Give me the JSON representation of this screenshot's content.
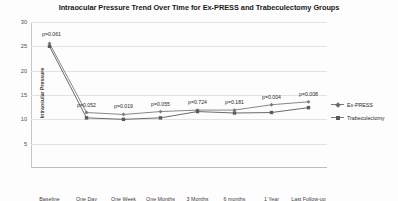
{
  "chart_data": {
    "type": "line",
    "title": "Intraocular Pressure Trend Over Time for Ex-PRESS and Trabeculectomy Groups",
    "xlabel": "",
    "ylabel": "Intraocular Pressure",
    "categories": [
      "Baseline",
      "One Day",
      "One Week",
      "One Months",
      "3 Months",
      "6 months",
      "1 Year",
      "Last Follow-up"
    ],
    "ylim": [
      0,
      30
    ],
    "yticks": [
      5,
      10,
      15,
      20,
      25,
      30
    ],
    "grid": true,
    "legend_position": "right",
    "series": [
      {
        "name": "Ex-PRESS",
        "values": [
          25.6,
          11.4,
          11.0,
          11.6,
          11.9,
          11.9,
          13.0,
          13.6
        ],
        "color": "#7a7a7a",
        "marker": "diamond"
      },
      {
        "name": "Trabeculectomy",
        "values": [
          25.0,
          10.3,
          10.0,
          10.3,
          11.6,
          11.3,
          11.4,
          12.4
        ],
        "color": "#5a5a5a",
        "marker": "square"
      }
    ],
    "annotations": [
      {
        "text": "p=0.061",
        "category": "Baseline"
      },
      {
        "text": "p=0.052",
        "category": "One Day"
      },
      {
        "text": "p=0.019",
        "category": "One Week"
      },
      {
        "text": "p=0.055",
        "category": "One Months"
      },
      {
        "text": "p=0.724",
        "category": "3 Months"
      },
      {
        "text": "p=0.181",
        "category": "6 months"
      },
      {
        "text": "p=0.004",
        "category": "1 Year"
      },
      {
        "text": "p=0.008",
        "category": "Last Follow-up"
      }
    ]
  },
  "legend": {
    "items": [
      {
        "label": "Ex-PRESS"
      },
      {
        "label": "Trabeculectomy"
      }
    ]
  }
}
